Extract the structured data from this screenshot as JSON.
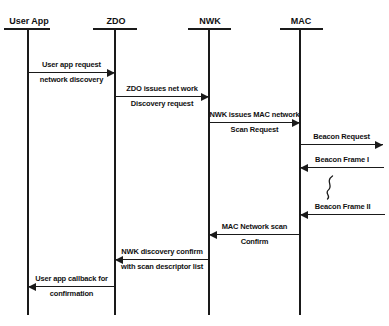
{
  "diagram": {
    "type": "sequence-diagram",
    "background": "#ffffff",
    "line_color": "#1a1a1a",
    "text_color": "#111111",
    "lifeline_top_y": 29,
    "lifeline_bottom_y": 315,
    "lifelines": [
      {
        "name": "User App",
        "x": 28,
        "bar_x1": 4,
        "bar_x2": 50
      },
      {
        "name": "ZDO",
        "x": 115,
        "bar_x1": 93,
        "bar_x2": 137
      },
      {
        "name": "NWK",
        "x": 209,
        "bar_x1": 188,
        "bar_x2": 231
      },
      {
        "name": "MAC",
        "x": 300,
        "bar_x1": 280,
        "bar_x2": 323
      }
    ],
    "messages": [
      {
        "from_lifeline": "User App",
        "to_lifeline": "ZDO",
        "from_x": 28,
        "to_x": 115,
        "y": 72,
        "direction": "right",
        "label_above": "User app request",
        "label_below": "network discovery"
      },
      {
        "from_lifeline": "ZDO",
        "to_lifeline": "NWK",
        "from_x": 115,
        "to_x": 209,
        "y": 96,
        "direction": "right",
        "label_above": "ZDO issues net work",
        "label_below": "Discovery request"
      },
      {
        "from_lifeline": "NWK",
        "to_lifeline": "MAC",
        "from_x": 209,
        "to_x": 300,
        "y": 122,
        "direction": "right",
        "label_above": "NWK issues MAC network",
        "label_below": "Scan Request"
      },
      {
        "from_lifeline": "MAC",
        "to_lifeline": null,
        "from_x": 300,
        "to_x": 383,
        "y": 144,
        "direction": "right",
        "label_above": "Beacon Request",
        "label_below": ""
      },
      {
        "from_lifeline": null,
        "to_lifeline": "MAC",
        "from_x": 384,
        "to_x": 300,
        "y": 167,
        "direction": "left",
        "label_above": "Beacon Frame I",
        "label_below": ""
      },
      {
        "from_lifeline": null,
        "to_lifeline": "MAC",
        "from_x": 385,
        "to_x": 300,
        "y": 214,
        "direction": "left",
        "label_above": "Beacon Frame II",
        "label_below": ""
      },
      {
        "from_lifeline": "MAC",
        "to_lifeline": "NWK",
        "from_x": 300,
        "to_x": 209,
        "y": 234,
        "direction": "left",
        "label_above": "MAC Network scan",
        "label_below": "Confirm"
      },
      {
        "from_lifeline": "NWK",
        "to_lifeline": "ZDO",
        "from_x": 209,
        "to_x": 115,
        "y": 259,
        "direction": "left",
        "label_above": "NWK discovery confirm",
        "label_below": "with scan descriptor list"
      },
      {
        "from_lifeline": "ZDO",
        "to_lifeline": "User App",
        "from_x": 115,
        "to_x": 28,
        "y": 286,
        "direction": "left",
        "label_above": "User app callback for",
        "label_below": "confirmation"
      }
    ],
    "break_symbol": {
      "x": 329,
      "y_top": 175,
      "y_bottom": 200
    }
  }
}
